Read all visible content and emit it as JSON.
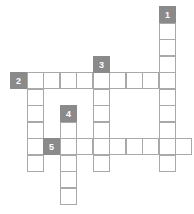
{
  "puzzle": {
    "cell_size": 16.5,
    "origin": {
      "x": 10,
      "y": 6
    },
    "colors": {
      "grid_line": "#a9a9a9",
      "number_cell": "#8a8a8a",
      "number_text": "#ffffff",
      "cell": "#ffffff"
    },
    "words": [
      {
        "number": "1",
        "direction": "down",
        "col": 9,
        "row": 0,
        "length": 10
      },
      {
        "number": "2",
        "direction": "across",
        "col": 0,
        "row": 4,
        "length": 10
      },
      {
        "number": "",
        "direction": "down",
        "col": 1,
        "row": 4,
        "length": 6
      },
      {
        "number": "3",
        "direction": "down",
        "col": 5,
        "row": 3,
        "length": 7
      },
      {
        "number": "4",
        "direction": "down",
        "col": 3,
        "row": 6,
        "length": 6
      },
      {
        "number": "5",
        "direction": "across",
        "col": 2,
        "row": 8,
        "length": 9
      }
    ]
  }
}
